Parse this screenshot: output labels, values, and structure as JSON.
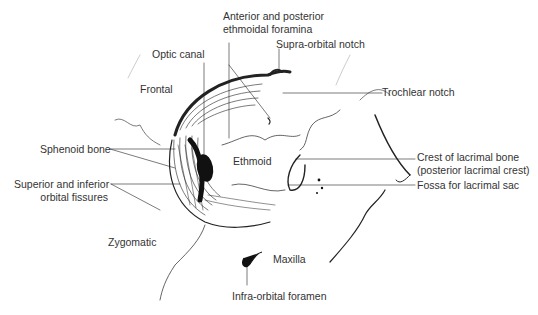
{
  "diagram": {
    "labels": {
      "anterior_posterior_1": "Anterior and posterior",
      "anterior_posterior_2": "ethmoidal foramina",
      "optic_canal": "Optic canal",
      "supra_orbital": "Supra-orbital notch",
      "frontal": "Frontal",
      "trochlear": "Trochlear notch",
      "sphenoid": "Sphenoid bone",
      "ethmoid": "Ethmoid",
      "crest_1": "Crest of lacrimal bone",
      "crest_2": "(posterior lacrimal crest)",
      "fossa": "Fossa for lacrimal sac",
      "fissures_1": "Superior and inferior",
      "fissures_2": "orbital fissures",
      "zygomatic": "Zygomatic",
      "maxilla": "Maxilla",
      "infra_orbital": "Infra-orbital foramen"
    }
  }
}
